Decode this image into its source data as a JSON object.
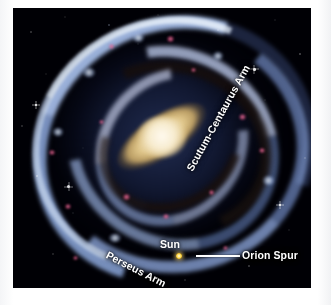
{
  "figure": {
    "kind": "milky-way-artist-impression",
    "background_color": "#000005",
    "mount_color": "#ffffff"
  },
  "labels": {
    "scutum_centaurus_arm": "Scutum-Centaurus Arm",
    "perseus_arm": "Perseus Arm",
    "sun": "Sun",
    "orion_spur": "Orion Spur"
  },
  "markers": {
    "sun_dot_color": "#ffe169",
    "orion_leader_line_color": "#ffffff"
  },
  "palette": {
    "space": "#000005",
    "arm_blue": "#aac8f5",
    "arm_blue_bright": "#e1eeff",
    "dust_lane": "#16100c",
    "core_cream": "#fdf4dd",
    "core_tan": "#ddc387",
    "nebula_pink": "#ff82aa",
    "label_text": "#ffffff"
  }
}
